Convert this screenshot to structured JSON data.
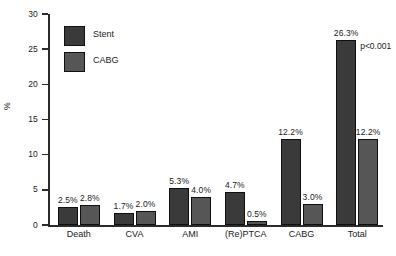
{
  "chart_data": {
    "type": "bar",
    "title": "",
    "xlabel": "",
    "ylabel": "%",
    "ylim": [
      0,
      30
    ],
    "yticks": [
      0,
      5,
      10,
      15,
      20,
      25,
      30
    ],
    "ytick_labels": [
      "0",
      "5",
      "10",
      "15",
      "20",
      "25",
      "30"
    ],
    "grid": false,
    "legend_position": "upper-left-inside",
    "categories": [
      "Death",
      "CVA",
      "AMI",
      "(Re)PTCA",
      "CABG",
      "Total"
    ],
    "series": [
      {
        "name": "Stent",
        "color": "#3a3a3a",
        "values": [
          2.5,
          1.7,
          5.3,
          4.7,
          12.2,
          26.3
        ],
        "value_labels": [
          "2.5%",
          "1.7%",
          "5.3%",
          "4.7%",
          "12.2%",
          "26.3%"
        ]
      },
      {
        "name": "CABG",
        "color": "#565656",
        "values": [
          2.8,
          2.0,
          4.0,
          0.5,
          3.0,
          12.2
        ],
        "value_labels": [
          "2.8%",
          "2.0%",
          "4.0%",
          "0.5%",
          "3.0%",
          "12.2%"
        ]
      }
    ],
    "annotations": [
      {
        "text": "p<0.001",
        "target": "Total"
      }
    ]
  },
  "legend": {
    "items": [
      {
        "label": "Stent"
      },
      {
        "label": "CABG"
      }
    ]
  },
  "axis": {
    "y_title": "%"
  }
}
